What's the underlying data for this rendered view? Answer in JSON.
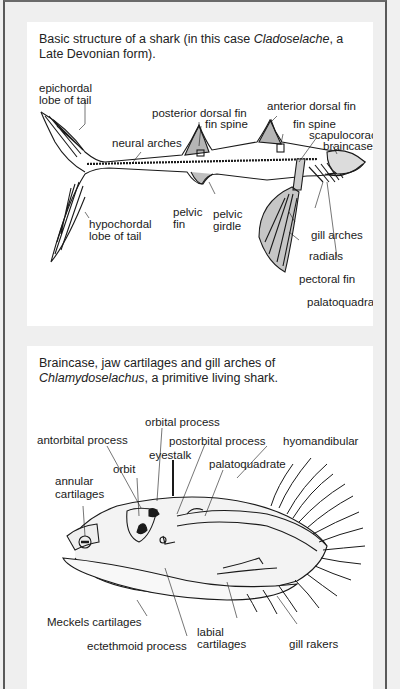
{
  "figure1": {
    "caption_pre": "Basic structure of a shark (in this case ",
    "caption_italic": "Cladoselache",
    "caption_post": ", a Late Devonian form).",
    "labels": {
      "epichordal_1": "epichordal",
      "epichordal_2": "lobe of tail",
      "posterior_dorsal_fin": "posterior dorsal fin",
      "fin_spine_posterior": "fin spine",
      "anterior_dorsal_fin": "anterior dorsal fin",
      "neural_arches": "neural arches",
      "fin_spine_anterior": "fin spine",
      "scapulocoracoid": "scapulocoracoid",
      "braincase": "braincase",
      "pelvic_fin_1": "pelvic",
      "pelvic_fin_2": "fin",
      "pelvic_girdle_1": "pelvic",
      "pelvic_girdle_2": "girdle",
      "hypochordal_1": "hypochordal",
      "hypochordal_2": "lobe of tail",
      "gill_arches": "gill arches",
      "radials": "radials",
      "pectoral_fin": "pectoral fin",
      "palatoquadrate": "palatoquadrate"
    }
  },
  "figure2": {
    "caption_line1": "Braincase, jaw cartilages and gill arches of",
    "caption_italic": "Chlamydoselachus",
    "caption_post": ", a primitive living shark.",
    "labels": {
      "orbital_process": "orbital process",
      "antorbital_process": "antorbital process",
      "postorbital_process": "postorbital process",
      "hyomandibular": "hyomandibular",
      "eyestalk": "eyestalk",
      "orbit": "orbit",
      "palatoquadrate": "palatoquadrate",
      "annular_1": "annular",
      "annular_2": "cartilages",
      "meckels": "Meckels cartilages",
      "labial_1": "labial",
      "labial_2": "cartilages",
      "gill_rakers": "gill rakers",
      "ectethmoid": "ectethmoid process"
    }
  },
  "colors": {
    "background": "#efefef",
    "panel": "#ffffff",
    "ink": "#1a1a1a",
    "frame_border": "#5a5a5a"
  }
}
